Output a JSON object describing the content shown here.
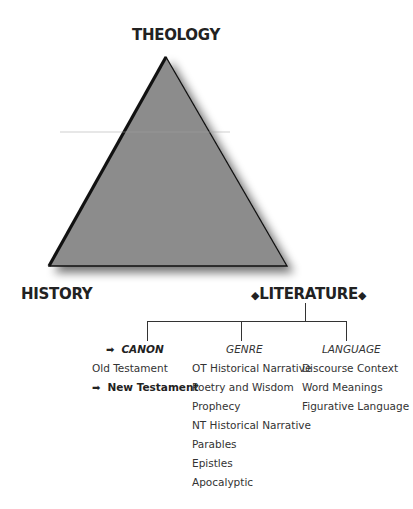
{
  "diagram": {
    "type": "interpretive-triad",
    "corners": {
      "top": "THEOLOGY",
      "bottom_left": "HISTORY",
      "bottom_right": "LITERATURE",
      "bottom_right_marker": "◆"
    },
    "triangle": {
      "fill": "#8c8c8c",
      "edge": "#111111"
    },
    "branches": [
      {
        "heading": "CANON",
        "heading_marker": "➡",
        "heading_highlighted": true,
        "items": [
          {
            "label": "Old Testament",
            "highlighted": false
          },
          {
            "label": "New Testament",
            "highlighted": true,
            "marker": "➡"
          }
        ]
      },
      {
        "heading": "GENRE",
        "heading_highlighted": false,
        "items": [
          {
            "label": "OT Historical Narrative"
          },
          {
            "label": "Poetry and Wisdom"
          },
          {
            "label": "Prophecy"
          },
          {
            "label": "NT Historical Narrative"
          },
          {
            "label": "Parables"
          },
          {
            "label": "Epistles"
          },
          {
            "label": "Apocalyptic"
          }
        ]
      },
      {
        "heading": "LANGUAGE",
        "heading_highlighted": false,
        "items": [
          {
            "label": "Discourse Context"
          },
          {
            "label": "Word Meanings"
          },
          {
            "label": "Figurative Language"
          }
        ]
      }
    ]
  }
}
